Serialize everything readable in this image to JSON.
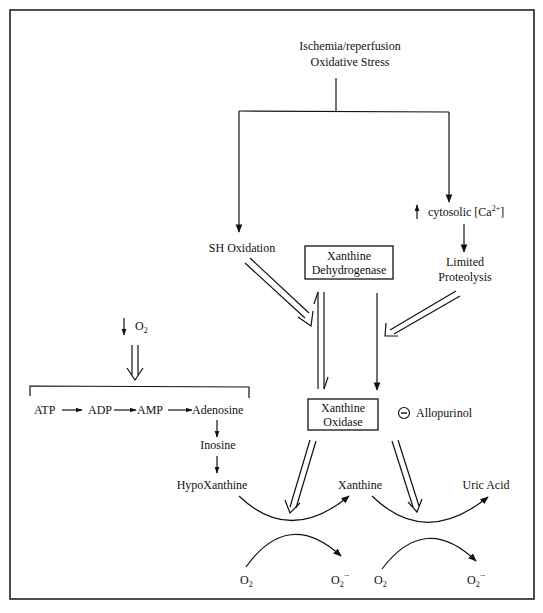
{
  "diagram": {
    "title_line1": "Ischemia/reperfusion",
    "title_line2": "Oxidative Stress",
    "left_branch": "SH Oxidation",
    "right_branch": {
      "prefix_arrow": "↑",
      "calcium_text": "cytosolic [Ca",
      "calcium_charge": "2+",
      "calcium_close": "]",
      "proteolysis_line1": "Limited",
      "proteolysis_line2": "Proteolysis"
    },
    "enzyme_dehydrogenase": {
      "line1": "Xanthine",
      "line2": "Dehydrogenase"
    },
    "enzyme_oxidase": {
      "line1": "Xanthine",
      "line2": "Oxidase"
    },
    "inhibitor": {
      "symbol": "⊖",
      "name": "Allopurinol"
    },
    "oxygen_drop": {
      "arrow": "↓",
      "label": "O",
      "subscript": "2"
    },
    "atp_chain": [
      "ATP",
      "ADP",
      "AMP",
      "Adenosine"
    ],
    "purine_path": [
      "Inosine",
      "HypoXanthine",
      "Xanthine",
      "Uric Acid"
    ],
    "reactions": [
      {
        "substrate": "HypoXanthine",
        "product": "Xanthine",
        "cosubstrate": "O2",
        "coproduct": "O2·-"
      },
      {
        "substrate": "Xanthine",
        "product": "Uric Acid",
        "cosubstrate": "O2",
        "coproduct": "O2·-"
      }
    ],
    "o2": {
      "base": "O",
      "sub": "2",
      "radical_sup": "·-"
    }
  }
}
